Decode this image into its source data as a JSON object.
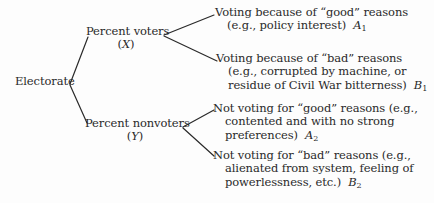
{
  "diagram": {
    "root": {
      "label": "Electorate"
    },
    "branches": [
      {
        "label": "Percent voters",
        "variable": "X",
        "leaves": [
          {
            "lines": [
              "Voting because of “good” reasons",
              "(e.g., policy interest)"
            ],
            "symbol": "A",
            "subscript": "1"
          },
          {
            "lines": [
              "Voting because of “bad” reasons",
              "(e.g., corrupted by machine, or",
              "residue of Civil War bitterness)"
            ],
            "symbol": "B",
            "subscript": "1"
          }
        ]
      },
      {
        "label": "Percent nonvoters",
        "variable": "Y",
        "leaves": [
          {
            "lines": [
              "Not voting for “good” reasons (e.g.,",
              "contented and with no strong",
              "preferences)"
            ],
            "symbol": "A",
            "subscript": "2"
          },
          {
            "lines": [
              "Not voting for “bad” reasons (e.g.,",
              "alienated from system, feeling of",
              "powerlessness, etc.)"
            ],
            "symbol": "B",
            "subscript": "2"
          }
        ]
      }
    ],
    "edge_color": "#2a2a2a",
    "text_color": "#2a2a2a"
  }
}
